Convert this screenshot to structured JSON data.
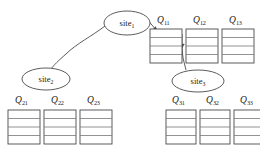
{
  "diagram": {
    "stroke_color": "#3c3c3c",
    "row_color": "#6e6e6e",
    "background": "#ffffff",
    "sites": [
      {
        "id": "site1",
        "label": "site",
        "index": "1",
        "cx": 127,
        "cy": 23,
        "rx": 23,
        "ry": 12
      },
      {
        "id": "site2",
        "label": "site",
        "index": "2",
        "cx": 46,
        "cy": 79,
        "rx": 24,
        "ry": 11
      },
      {
        "id": "site3",
        "label": "site",
        "index": "3",
        "cx": 198,
        "cy": 81,
        "rx": 26,
        "ry": 11
      }
    ],
    "tables": [
      {
        "id": "q11",
        "label": "Q",
        "sub": "11",
        "x": 150,
        "y": 29,
        "w": 32,
        "h": 34,
        "rows": 4
      },
      {
        "id": "q12",
        "label": "Q",
        "sub": "12",
        "x": 186,
        "y": 29,
        "w": 32,
        "h": 34,
        "rows": 4
      },
      {
        "id": "q13",
        "label": "Q",
        "sub": "13",
        "x": 222,
        "y": 29,
        "w": 32,
        "h": 34,
        "rows": 4
      },
      {
        "id": "q21",
        "label": "Q",
        "sub": "21",
        "x": 8,
        "y": 110,
        "w": 32,
        "h": 34,
        "rows": 4
      },
      {
        "id": "q22",
        "label": "Q",
        "sub": "22",
        "x": 44,
        "y": 110,
        "w": 32,
        "h": 34,
        "rows": 4
      },
      {
        "id": "q23",
        "label": "Q",
        "sub": "23",
        "x": 80,
        "y": 110,
        "w": 32,
        "h": 34,
        "rows": 4
      },
      {
        "id": "q31",
        "label": "Q",
        "sub": "31",
        "x": 166,
        "y": 110,
        "w": 30,
        "h": 34,
        "rows": 4
      },
      {
        "id": "q32",
        "label": "Q",
        "sub": "32",
        "x": 200,
        "y": 110,
        "w": 30,
        "h": 34,
        "rows": 4
      },
      {
        "id": "q33",
        "label": "Q",
        "sub": "33",
        "x": 234,
        "y": 110,
        "w": 30,
        "h": 34,
        "rows": 4
      }
    ],
    "connections": [
      {
        "id": "site1-to-site2",
        "kind": "curve",
        "from": "site1",
        "to": "site2"
      },
      {
        "id": "site1-to-q11",
        "kind": "arrow",
        "from": "site1",
        "to": "q11"
      },
      {
        "id": "q11-to-site3",
        "kind": "arrow",
        "from": "q11",
        "to": "site3"
      }
    ]
  }
}
